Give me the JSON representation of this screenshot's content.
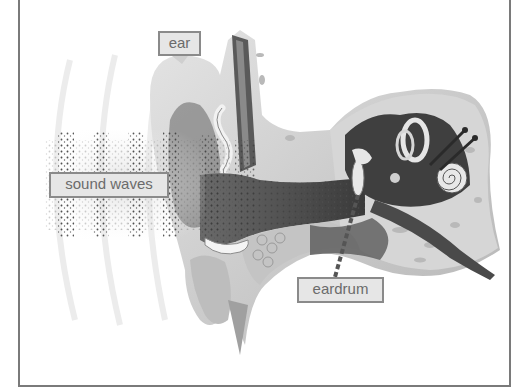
{
  "diagram": {
    "labels": {
      "ear": "ear",
      "sound_waves": "sound waves",
      "eardrum": "eardrum"
    },
    "palette": {
      "frame": "#7a7a7a",
      "label_bg": "#e6e6e6",
      "label_border": "#8a8a8a",
      "label_text": "#6b6b6b",
      "tissue_light": "#d9d9d9",
      "tissue_mid": "#a8a8a8",
      "tissue_dark": "#4a4a4a",
      "canal_dark": "#3c3c3c"
    }
  }
}
